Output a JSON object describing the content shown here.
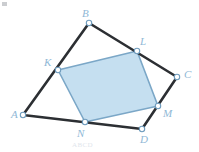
{
  "figure": {
    "type": "geometry-diagram",
    "canvas": {
      "width": 199,
      "height": 152,
      "background": "#ffffff"
    },
    "colors": {
      "outer_stroke": "#2c2f33",
      "inner_stroke": "#7ba7c7",
      "shade_fill": "#c5dff0",
      "label_text": "#8fb8d6",
      "vertex_fill": "#ffffff",
      "vertex_stroke": "#6f9cbd"
    },
    "outer_polygon": {
      "name": "ABCD",
      "points": "23,115 89,23 177,77 142,129",
      "vertices": [
        {
          "id": "A",
          "label": "A",
          "x": 23,
          "y": 115,
          "label_x": 11,
          "label_y": 118
        },
        {
          "id": "B",
          "label": "B",
          "x": 89,
          "y": 23,
          "label_x": 82,
          "label_y": 17
        },
        {
          "id": "C",
          "label": "C",
          "x": 177,
          "y": 77,
          "label_x": 184,
          "label_y": 78
        },
        {
          "id": "D",
          "label": "D",
          "x": 142,
          "y": 129,
          "label_x": 140,
          "label_y": 143
        }
      ]
    },
    "inner_polygon": {
      "name": "KLMN",
      "points": "58,70 137,51 158,106 85,122",
      "vertices": [
        {
          "id": "K",
          "label": "K",
          "x": 58,
          "y": 70,
          "label_x": 44,
          "label_y": 66
        },
        {
          "id": "L",
          "label": "L",
          "x": 137,
          "y": 51,
          "label_x": 140,
          "label_y": 45
        },
        {
          "id": "M",
          "label": "M",
          "x": 158,
          "y": 106,
          "label_x": 163,
          "label_y": 117
        },
        {
          "id": "N",
          "label": "N",
          "x": 85,
          "y": 122,
          "label_x": 77,
          "label_y": 137
        }
      ]
    },
    "ghost_text": "ABCD"
  }
}
